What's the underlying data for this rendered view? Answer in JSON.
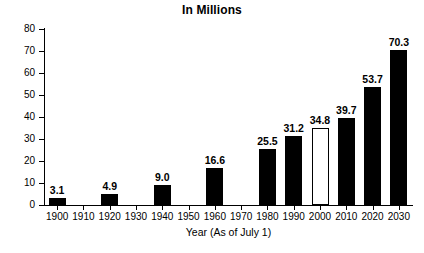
{
  "chart_data": {
    "type": "bar",
    "title": "In Millions",
    "xlabel": "Year (As of July 1)",
    "ylabel": "",
    "ylim": [
      0,
      80
    ],
    "ytick_step": 10,
    "yticks": [
      "80",
      "70",
      "60",
      "50",
      "40",
      "30",
      "20",
      "10",
      "0"
    ],
    "grid": false,
    "legend": null,
    "categories": [
      "1900",
      "1910",
      "1920",
      "1930",
      "1940",
      "1950",
      "1960",
      "1970",
      "1980",
      "1990",
      "2000",
      "2010",
      "2020",
      "2030"
    ],
    "values": [
      3.1,
      null,
      4.9,
      null,
      9.0,
      null,
      16.6,
      null,
      25.5,
      31.2,
      34.8,
      39.7,
      53.7,
      70.3
    ],
    "value_labels": [
      "3.1",
      "",
      "4.9",
      "",
      "9.0",
      "",
      "16.6",
      "",
      "25.5",
      "31.2",
      "34.8",
      "39.7",
      "53.7",
      "70.3"
    ],
    "bar_styles": [
      "solid",
      "none",
      "solid",
      "none",
      "solid",
      "none",
      "solid",
      "none",
      "solid",
      "solid",
      "hollow",
      "solid",
      "solid",
      "solid"
    ],
    "colors": {
      "solid_fill": "#000000",
      "hollow_fill": "#ffffff",
      "hollow_border": "#000000",
      "axis": "#000000",
      "text": "#000000",
      "background": "#ffffff"
    }
  }
}
